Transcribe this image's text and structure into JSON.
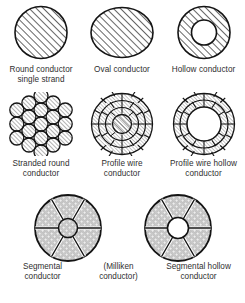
{
  "figure": {
    "background": "#ffffff",
    "stroke_color": "#1a1a1a",
    "text_color": "#2f2f2f",
    "hatch_color": "#333333",
    "segment_fill": "#c9c9c9"
  },
  "rows": [
    {
      "id": "row-1",
      "items": [
        {
          "id": "round-conductor-single-strand",
          "shape": "hatched-circle",
          "caption": "Round conductor\nsingle strand"
        },
        {
          "id": "oval-conductor",
          "shape": "hatched-ellipse",
          "caption": "Oval conductor"
        },
        {
          "id": "hollow-conductor",
          "shape": "hatched-annulus",
          "caption": "Hollow conductor"
        }
      ]
    },
    {
      "id": "row-2",
      "items": [
        {
          "id": "stranded-round-conductor",
          "shape": "stranded-wires-cluster",
          "caption": "Stranded round\nconductor"
        },
        {
          "id": "profile-wire-conductor",
          "shape": "profile-wire-rings",
          "caption": "Profile wire\nconductor"
        },
        {
          "id": "profile-wire-hollow-conductor",
          "shape": "profile-wire-rings-hollow",
          "caption": "Profile wire hollow\nconductor"
        }
      ]
    },
    {
      "id": "row-3",
      "items": [
        {
          "id": "segmental-conductor",
          "shape": "six-segment-disc",
          "caption": "Segmental\nconductor"
        },
        {
          "id": "milliken-conductor",
          "shape": "none",
          "caption": "(Milliken\nconductor)"
        },
        {
          "id": "segmental-hollow-conductor",
          "shape": "six-segment-disc-hollow",
          "caption": "Segmental hollow\nconductor"
        }
      ]
    }
  ]
}
